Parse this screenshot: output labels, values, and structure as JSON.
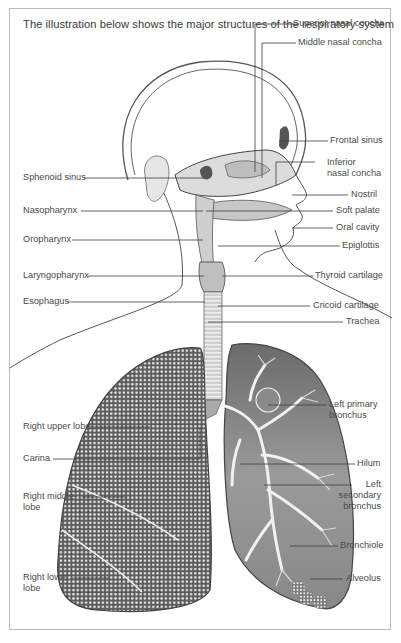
{
  "figure": {
    "caption": "The illustration below shows the major structures of the respiratory system",
    "labels_right": [
      {
        "id": "superior-nasal-concha",
        "text": "Superior nasal concha"
      },
      {
        "id": "middle-nasal-concha",
        "text": "Middle nasal concha"
      },
      {
        "id": "frontal-sinus",
        "text": "Frontal sinus"
      },
      {
        "id": "inferior-nasal-concha",
        "line1": "Inferior",
        "line2": "nasal concha"
      },
      {
        "id": "nostril",
        "text": "Nostril"
      },
      {
        "id": "soft-palate",
        "text": "Soft palate"
      },
      {
        "id": "oral-cavity",
        "text": "Oral cavity"
      },
      {
        "id": "epiglottis",
        "text": "Epiglottis"
      },
      {
        "id": "thyroid-cartilage",
        "text": "Thyroid cartilage"
      },
      {
        "id": "cricoid-cartilage",
        "text": "Cricoid cartilage"
      },
      {
        "id": "trachea",
        "text": "Trachea"
      },
      {
        "id": "left-primary-bronchus",
        "line1": "Left primary",
        "line2": "bronchus"
      },
      {
        "id": "hilum",
        "text": "Hilum"
      },
      {
        "id": "left-secondary-bronchus",
        "line1": "Left",
        "line2": "secondary",
        "line3": "bronchus"
      },
      {
        "id": "bronchiole",
        "text": "Bronchiole"
      },
      {
        "id": "alveolus",
        "text": "Alveolus"
      }
    ],
    "labels_left": [
      {
        "id": "sphenoid-sinus",
        "text": "Sphenoid sinus"
      },
      {
        "id": "nasopharynx",
        "text": "Nasopharynx"
      },
      {
        "id": "oropharynx",
        "text": "Oropharynx"
      },
      {
        "id": "laryngopharynx",
        "text": "Laryngopharynx"
      },
      {
        "id": "esophagus",
        "text": "Esophagus"
      },
      {
        "id": "right-upper-lobe",
        "text": "Right upper lobe"
      },
      {
        "id": "carina",
        "text": "Carina"
      },
      {
        "id": "right-middle-lobe",
        "line1": "Right middle",
        "line2": "lobe"
      },
      {
        "id": "right-lower-lobe",
        "line1": "Right lower",
        "line2": "lobe"
      }
    ],
    "colors": {
      "line": "#3c3c3c",
      "text": "#4a4a4a",
      "lung_dark": "#5a5a5a",
      "border": "#b9b9b9"
    }
  }
}
